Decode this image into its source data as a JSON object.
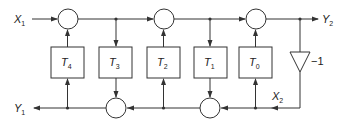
{
  "diagram": {
    "type": "lattice filter signal-flow block diagram",
    "inputs": {
      "x1": {
        "main": "X",
        "sub": "1"
      },
      "x2": {
        "main": "X",
        "sub": "2"
      }
    },
    "outputs": {
      "y1": {
        "main": "Y",
        "sub": "1"
      },
      "y2": {
        "main": "Y",
        "sub": "2"
      }
    },
    "blocks": [
      {
        "main": "T",
        "sub": "4"
      },
      {
        "main": "T",
        "sub": "3"
      },
      {
        "main": "T",
        "sub": "2"
      },
      {
        "main": "T",
        "sub": "1"
      },
      {
        "main": "T",
        "sub": "0"
      }
    ],
    "gain": {
      "label": "−1"
    },
    "summing_nodes_top": 3,
    "summing_nodes_bottom": 2
  }
}
